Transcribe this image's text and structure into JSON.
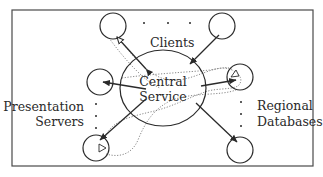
{
  "diagram": {
    "labels": {
      "clients": "Clients",
      "central_line1": "Central",
      "central_line2": "Service",
      "presentation_line1": "Presentation",
      "presentation_line2": "Servers",
      "regional_line1": "Regional",
      "regional_line2": "Databases"
    },
    "nodes": [
      {
        "id": "central-service",
        "type": "ellipse"
      },
      {
        "id": "client-1",
        "group": "Clients"
      },
      {
        "id": "client-n",
        "group": "Clients"
      },
      {
        "id": "presentation-server-1",
        "group": "Presentation Servers"
      },
      {
        "id": "presentation-server-n",
        "group": "Presentation Servers"
      },
      {
        "id": "regional-database-1",
        "group": "Regional Databases"
      },
      {
        "id": "regional-database-n",
        "group": "Regional Databases"
      }
    ],
    "edges": [
      {
        "from": "central-service",
        "to": "client-1",
        "style": "solid",
        "arrow": "both"
      },
      {
        "from": "client-n",
        "to": "central-service",
        "style": "solid",
        "arrow": "end"
      },
      {
        "from": "central-service",
        "to": "presentation-server-1",
        "style": "solid",
        "arrow": "end"
      },
      {
        "from": "central-service",
        "to": "presentation-server-n",
        "style": "solid",
        "arrow": "end"
      },
      {
        "from": "central-service",
        "to": "regional-database-1",
        "style": "solid",
        "arrow": "end"
      },
      {
        "from": "central-service",
        "to": "regional-database-n",
        "style": "solid",
        "arrow": "end"
      },
      {
        "from": "client-1",
        "to": "regional-database-1",
        "style": "dotted"
      },
      {
        "from": "presentation-server-n",
        "to": "regional-database-1",
        "style": "dotted"
      }
    ],
    "colors": {
      "stroke": "#2a2a2a",
      "dotted": "#7a7a7a",
      "background": "#ffffff"
    }
  }
}
